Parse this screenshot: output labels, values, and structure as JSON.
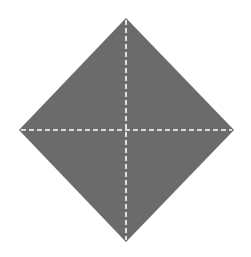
{
  "diagram": {
    "shape": "diamond",
    "fill_color": "#6b6b6b",
    "background_color": "#ffffff",
    "guide_line_color": "#ffffff",
    "vertices": {
      "top": [
        126,
        18
      ],
      "right": [
        234,
        130
      ],
      "bottom": [
        126,
        242
      ],
      "left": [
        19,
        130
      ]
    },
    "guides": [
      {
        "orientation": "vertical",
        "style": "dashed"
      },
      {
        "orientation": "horizontal",
        "style": "dashed"
      }
    ]
  }
}
